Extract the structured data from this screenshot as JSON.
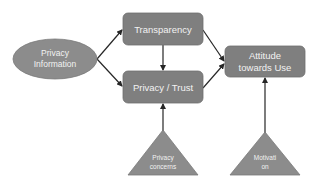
{
  "diagram": {
    "colors": {
      "box_fill": "#7f7f7f",
      "box_stroke": "#6e6e6e",
      "ellipse_fill": "#8c8c8c",
      "triangle_fill": "#8c8c8c",
      "arrow": "#262626",
      "text": "#f2f2f2"
    },
    "nodes": {
      "privacy_information": {
        "shape": "ellipse",
        "line1": "Privacy",
        "line2": "Information"
      },
      "transparency": {
        "shape": "rounded-rect",
        "label": "Transparency"
      },
      "privacy_trust": {
        "shape": "rounded-rect",
        "label": "Privacy / Trust"
      },
      "attitude": {
        "shape": "rounded-rect",
        "line1": "Attitude",
        "line2": "towards Use"
      },
      "privacy_concerns": {
        "shape": "triangle",
        "line1": "Privacy",
        "line2": "concerns"
      },
      "motivation": {
        "shape": "triangle",
        "line1": "Motivati",
        "line2": "on"
      }
    },
    "edges": [
      {
        "from": "privacy_information",
        "to": "transparency"
      },
      {
        "from": "privacy_information",
        "to": "privacy_trust"
      },
      {
        "from": "transparency",
        "to": "privacy_trust"
      },
      {
        "from": "transparency",
        "to": "attitude"
      },
      {
        "from": "privacy_trust",
        "to": "attitude"
      },
      {
        "from": "privacy_concerns",
        "to": "privacy_trust"
      },
      {
        "from": "motivation",
        "to": "attitude"
      }
    ]
  }
}
